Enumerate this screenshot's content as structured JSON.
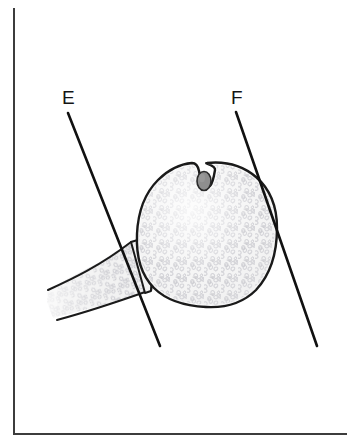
{
  "figure": {
    "background_color": "#ffffff",
    "frame": {
      "name": "figure-border",
      "style": "left and bottom rule only",
      "color": "#3c3c3c",
      "left_x": 13,
      "top_y": 8,
      "bottom_y": 434,
      "right_x": 347
    }
  },
  "labels": [
    {
      "id": "E",
      "text": "E",
      "x": 62,
      "y": 104,
      "leader_line": {
        "name": "leader-line-e",
        "x1": 68,
        "y1": 113,
        "x2": 160,
        "y2": 346,
        "color": "#111111",
        "width": 2.6
      }
    },
    {
      "id": "F",
      "text": "F",
      "x": 231,
      "y": 104,
      "leader_line": {
        "name": "leader-line-f",
        "x1": 236,
        "y1": 112,
        "x2": 317,
        "y2": 346,
        "color": "#111111",
        "width": 2.6
      }
    }
  ],
  "structures": {
    "body": {
      "name": "bone-head-cross-section",
      "description": "rounded bone head cross-section with superior notch",
      "fill_color": "#f1f1f1",
      "outline_color": "#1a1a1a",
      "outline_width": 2.4,
      "bounds": {
        "x": 137,
        "y": 162,
        "width": 140,
        "height": 146
      }
    },
    "notch_nodule": {
      "name": "notch-nodule",
      "description": "small oval nodule seated in the superior notch",
      "fill_color": "#8e8e8e",
      "outline_color": "#2b2b2b",
      "cx": 204,
      "cy": 181,
      "rx": 7,
      "ry": 9.5
    },
    "stalk": {
      "name": "bone-neck-stalk",
      "description": "tapering neck/stalk extending to lower left, fading at open end",
      "fill_color": "#f1f1f1",
      "outline_color": "#1a1a1a",
      "outline_width": 2.0
    },
    "trabecular_texture": {
      "name": "trabecular-texture",
      "description": "cancellous bone speckle of small open loops and squiggles",
      "mark_color": "#c6c6cc",
      "mark_color_alt": "#b6b6bd",
      "density": "high"
    }
  },
  "colors": {
    "outline": "#1a1a1a",
    "frame": "#3c3c3c",
    "fill": "#f1f1f1",
    "texture": "#c6c6cc",
    "nodule": "#8e8e8e",
    "label": "#141414",
    "background": "#ffffff"
  }
}
